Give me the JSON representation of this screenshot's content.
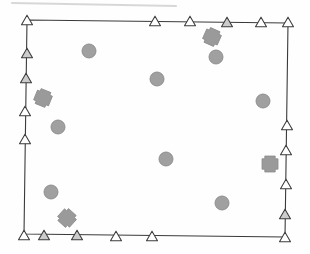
{
  "figure": {
    "title": "",
    "background_color": "#fefefe",
    "canvas": {
      "width": 310,
      "height": 254
    }
  },
  "scan_artifact": {
    "name": "top-edge-scan-streak",
    "visible": true,
    "color": "#b9b9b9",
    "x1": 12,
    "y1": 3,
    "x2": 176,
    "y2": 6,
    "width": 2.2,
    "opacity": 0.55
  },
  "boundary": {
    "name": "plot-boundary",
    "stroke_color": "#3a3a3a",
    "stroke_width": 1.1,
    "fill": "none",
    "closed": true,
    "corners": [
      {
        "label": "top-left",
        "x": 27,
        "y": 20
      },
      {
        "label": "top-right",
        "x": 288,
        "y": 23
      },
      {
        "label": "bottom-right",
        "x": 285,
        "y": 237
      },
      {
        "label": "bottom-left",
        "x": 24,
        "y": 234
      }
    ]
  },
  "legend_colors": {
    "triangle_fill_open": "#ffffff",
    "triangle_fill_shaded": "#cccccc",
    "triangle_stroke": "#3c3c3c",
    "circle_fill": "#a0a0a0",
    "circle_stroke": "#8a8a8a",
    "cross_fill": "#9a9a9a",
    "cross_stroke": "#8a8a8a"
  },
  "markers": {
    "triangles": {
      "symbol": "triangle-marker",
      "size": 11,
      "count": 22,
      "items": [
        {
          "id": "T01",
          "x": 27,
          "y": 20,
          "fill": "open",
          "edge": "corner-top-left"
        },
        {
          "id": "T02",
          "x": 155,
          "y": 21,
          "fill": "open",
          "edge": "top"
        },
        {
          "id": "T03",
          "x": 190,
          "y": 21,
          "fill": "open",
          "edge": "top"
        },
        {
          "id": "T04",
          "x": 227,
          "y": 22,
          "fill": "shaded",
          "edge": "top"
        },
        {
          "id": "T05",
          "x": 261,
          "y": 22,
          "fill": "open",
          "edge": "top"
        },
        {
          "id": "T06",
          "x": 288,
          "y": 22,
          "fill": "open",
          "edge": "corner-top-right"
        },
        {
          "id": "T07",
          "x": 287,
          "y": 125,
          "fill": "open",
          "edge": "right"
        },
        {
          "id": "T08",
          "x": 286,
          "y": 150,
          "fill": "open",
          "edge": "right"
        },
        {
          "id": "T09",
          "x": 286,
          "y": 184,
          "fill": "open",
          "edge": "right"
        },
        {
          "id": "T10",
          "x": 285,
          "y": 214,
          "fill": "shaded",
          "edge": "right"
        },
        {
          "id": "T11",
          "x": 285,
          "y": 237,
          "fill": "open",
          "edge": "corner-bottom-right"
        },
        {
          "id": "T12",
          "x": 152,
          "y": 236,
          "fill": "open",
          "edge": "bottom"
        },
        {
          "id": "T13",
          "x": 116,
          "y": 236,
          "fill": "open",
          "edge": "bottom"
        },
        {
          "id": "T14",
          "x": 77,
          "y": 235,
          "fill": "shaded",
          "edge": "bottom"
        },
        {
          "id": "T15",
          "x": 44,
          "y": 235,
          "fill": "shaded",
          "edge": "bottom"
        },
        {
          "id": "T16",
          "x": 24,
          "y": 235,
          "fill": "open",
          "edge": "corner-bottom-left"
        },
        {
          "id": "T17",
          "x": 25,
          "y": 139,
          "fill": "open",
          "edge": "left"
        },
        {
          "id": "T18",
          "x": 25,
          "y": 111,
          "fill": "open",
          "edge": "left"
        },
        {
          "id": "T19",
          "x": 26,
          "y": 78,
          "fill": "shaded",
          "edge": "left"
        },
        {
          "id": "T20",
          "x": 27,
          "y": 53,
          "fill": "shaded",
          "edge": "left"
        }
      ]
    },
    "circles": {
      "symbol": "circle-marker",
      "radius": 7,
      "count": 8,
      "items": [
        {
          "id": "C1",
          "x": 89,
          "y": 51
        },
        {
          "id": "C2",
          "x": 216,
          "y": 57
        },
        {
          "id": "C3",
          "x": 157,
          "y": 79
        },
        {
          "id": "C4",
          "x": 263,
          "y": 101
        },
        {
          "id": "C5",
          "x": 58,
          "y": 127
        },
        {
          "id": "C6",
          "x": 166,
          "y": 159
        },
        {
          "id": "C7",
          "x": 51,
          "y": 192
        },
        {
          "id": "C8",
          "x": 222,
          "y": 203
        }
      ]
    },
    "crosses": {
      "symbol": "cross-marker",
      "size": 16,
      "arm": 5.2,
      "count": 4,
      "items": [
        {
          "id": "X1",
          "x": 212,
          "y": 37,
          "rotation": 24
        },
        {
          "id": "X2",
          "x": 43,
          "y": 98,
          "rotation": 22
        },
        {
          "id": "X3",
          "x": 270,
          "y": 164,
          "rotation": 0
        },
        {
          "id": "X4",
          "x": 67,
          "y": 218,
          "rotation": 42
        }
      ]
    }
  }
}
